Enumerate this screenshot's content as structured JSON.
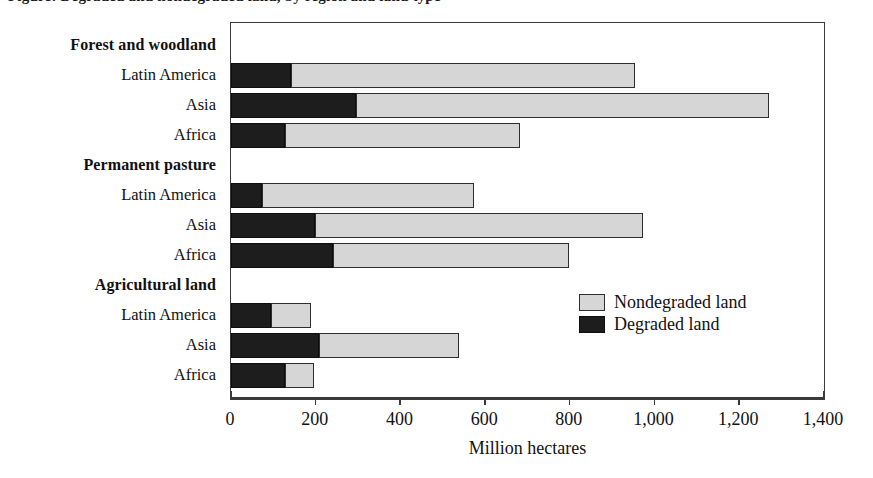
{
  "figure": {
    "title_clipped": "Figure: Degraded and nondegraded land, by region and land type",
    "axis_title": "Million hectares"
  },
  "legend": {
    "position": "inside-right-middle",
    "items": [
      {
        "key": "nondegraded",
        "label": "Nondegraded land",
        "color": "#d6d6d6"
      },
      {
        "key": "degraded",
        "label": "Degraded land",
        "color": "#1d1d1d"
      }
    ]
  },
  "axis": {
    "ticks": [
      "0",
      "200",
      "400",
      "600",
      "800",
      "1,000",
      "1,200",
      "1,400"
    ]
  },
  "rows": [
    {
      "label": "Forest and woodland",
      "type": "group"
    },
    {
      "label": "Latin America",
      "type": "bar",
      "degraded": 141,
      "nondegraded": 817,
      "total": 958
    },
    {
      "label": "Asia",
      "type": "bar",
      "degraded": 297,
      "nondegraded": 978,
      "total": 1275
    },
    {
      "label": "Africa",
      "type": "bar",
      "degraded": 129,
      "nondegraded": 556,
      "total": 685
    },
    {
      "label": "Permanent pasture",
      "type": "group"
    },
    {
      "label": "Latin America",
      "type": "bar",
      "degraded": 73,
      "nondegraded": 503,
      "total": 576
    },
    {
      "label": "Asia",
      "type": "bar",
      "degraded": 200,
      "nondegraded": 776,
      "total": 976
    },
    {
      "label": "Africa",
      "type": "bar",
      "degraded": 242,
      "nondegraded": 558,
      "total": 800
    },
    {
      "label": "Agricultural land",
      "type": "group"
    },
    {
      "label": "Latin America",
      "type": "bar",
      "degraded": 94,
      "nondegraded": 96,
      "total": 190
    },
    {
      "label": "Asia",
      "type": "bar",
      "degraded": 209,
      "nondegraded": 332,
      "total": 541
    },
    {
      "label": "Africa",
      "type": "bar",
      "degraded": 129,
      "nondegraded": 68,
      "total": 197
    }
  ],
  "chart_data": {
    "type": "bar",
    "orientation": "horizontal",
    "stacked": true,
    "title": "Degraded and nondegraded land, by region and land type",
    "xlabel": "Million hectares",
    "ylabel": "",
    "xlim": [
      0,
      1400
    ],
    "xticks": [
      0,
      200,
      400,
      600,
      800,
      1000,
      1200,
      1400
    ],
    "grid": false,
    "legend_position": "inside right middle",
    "groups": [
      "Forest and woodland",
      "Permanent pasture",
      "Agricultural land"
    ],
    "categories": [
      "Forest and woodland - Latin America",
      "Forest and woodland - Asia",
      "Forest and woodland - Africa",
      "Permanent pasture - Latin America",
      "Permanent pasture - Asia",
      "Permanent pasture - Africa",
      "Agricultural land - Latin America",
      "Agricultural land - Asia",
      "Agricultural land - Africa"
    ],
    "series": [
      {
        "name": "Degraded land",
        "color": "#1d1d1d",
        "values": [
          141,
          297,
          129,
          73,
          200,
          242,
          94,
          209,
          129
        ]
      },
      {
        "name": "Nondegraded land",
        "color": "#d6d6d6",
        "values": [
          817,
          978,
          556,
          503,
          776,
          558,
          96,
          332,
          68
        ]
      }
    ],
    "totals": [
      958,
      1275,
      685,
      576,
      976,
      800,
      190,
      541,
      197
    ]
  }
}
